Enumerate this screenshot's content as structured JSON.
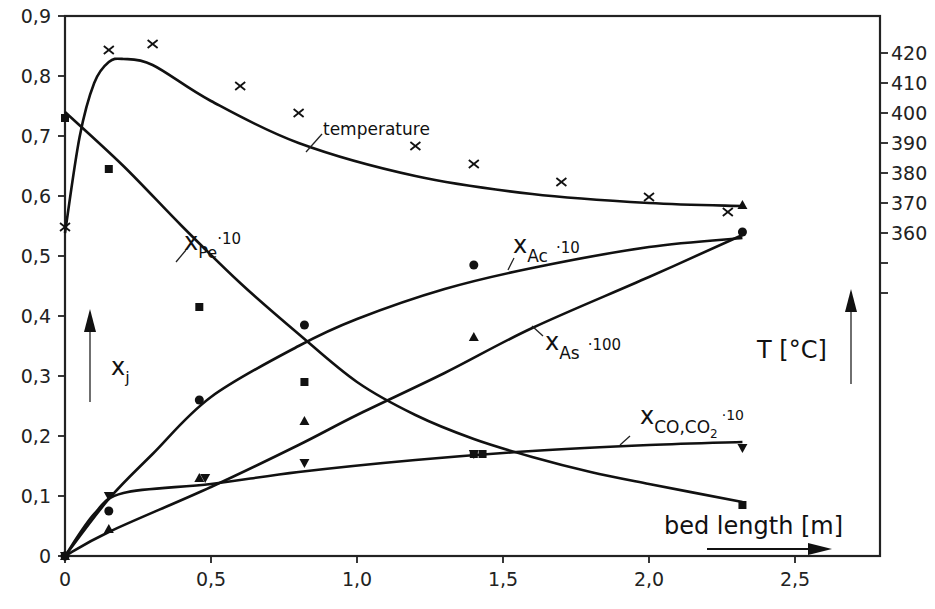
{
  "chart_data": {
    "type": "line",
    "title": "",
    "xlabel": "bed length [m]",
    "ylabel": "x_j",
    "ylabel_right": "T [°C]",
    "xlim": [
      0,
      2.8
    ],
    "ylim": [
      0,
      0.9
    ],
    "ylim_right_ticks": [
      360,
      420
    ],
    "x_ticks": [
      "0",
      "0,5",
      "1,0",
      "1,5",
      "2,0",
      "2,5"
    ],
    "y_ticks": [
      "0",
      "0,1",
      "0,2",
      "0,3",
      "0,4",
      "0,5",
      "0,6",
      "0,7",
      "0,8",
      "0,9"
    ],
    "y_right_ticks": [
      "360",
      "370",
      "380",
      "390",
      "400",
      "410",
      "420"
    ],
    "grid": false,
    "legend": "inline annotations",
    "series": [
      {
        "name": "temperature",
        "axis": "right",
        "marker": "x",
        "points_x": [
          0.0,
          0.15,
          0.3,
          0.6,
          0.8,
          1.2,
          1.4,
          1.7,
          2.0,
          2.27
        ],
        "points_y": [
          362,
          421,
          423,
          409,
          400,
          389,
          383,
          377,
          372,
          367
        ],
        "curve_x": [
          0.0,
          0.05,
          0.1,
          0.15,
          0.2,
          0.3,
          0.5,
          0.8,
          1.2,
          1.6,
          2.0,
          2.32
        ],
        "curve_y": [
          360,
          392,
          410,
          417,
          418,
          416,
          404,
          390,
          379,
          373,
          370,
          369
        ]
      },
      {
        "name": "x_Pe · 10",
        "axis": "left",
        "marker": "square",
        "points_x": [
          0.0,
          0.15,
          0.46,
          0.82,
          1.4,
          1.43,
          2.32
        ],
        "points_y": [
          0.73,
          0.645,
          0.415,
          0.29,
          0.17,
          0.17,
          0.085
        ],
        "curve_x": [
          0.0,
          0.2,
          0.4,
          0.6,
          0.8,
          1.0,
          1.2,
          1.4,
          1.6,
          1.8,
          2.0,
          2.32
        ],
        "curve_y": [
          0.74,
          0.65,
          0.55,
          0.455,
          0.37,
          0.29,
          0.235,
          0.195,
          0.165,
          0.14,
          0.12,
          0.09
        ]
      },
      {
        "name": "x_Ac · 10",
        "axis": "left",
        "marker": "circle",
        "points_x": [
          0.0,
          0.15,
          0.46,
          0.82,
          1.4,
          2.32
        ],
        "points_y": [
          0.0,
          0.075,
          0.26,
          0.385,
          0.485,
          0.54
        ],
        "curve_x": [
          0.0,
          0.15,
          0.3,
          0.5,
          0.8,
          1.0,
          1.3,
          1.6,
          2.0,
          2.32
        ],
        "curve_y": [
          0.0,
          0.095,
          0.17,
          0.265,
          0.35,
          0.395,
          0.445,
          0.48,
          0.515,
          0.53
        ]
      },
      {
        "name": "x_As · 100",
        "axis": "left",
        "marker": "triangle-up",
        "points_x": [
          0.0,
          0.15,
          0.46,
          0.82,
          1.4,
          2.32
        ],
        "points_y": [
          0.0,
          0.045,
          0.13,
          0.225,
          0.365,
          0.585
        ],
        "curve_x": [
          0.0,
          0.15,
          0.5,
          0.8,
          1.0,
          1.3,
          1.6,
          2.0,
          2.32
        ],
        "curve_y": [
          0.0,
          0.04,
          0.115,
          0.185,
          0.235,
          0.305,
          0.38,
          0.465,
          0.535
        ]
      },
      {
        "name": "x_CO,CO2 · 10",
        "axis": "left",
        "marker": "triangle-down",
        "points_x": [
          0.0,
          0.15,
          0.48,
          0.82,
          1.4,
          2.32
        ],
        "points_y": [
          0.0,
          0.1,
          0.13,
          0.155,
          0.17,
          0.18
        ],
        "curve_x": [
          0.0,
          0.1,
          0.2,
          0.5,
          0.8,
          1.2,
          1.6,
          2.0,
          2.32
        ],
        "curve_y": [
          0.0,
          0.07,
          0.105,
          0.12,
          0.14,
          0.16,
          0.175,
          0.185,
          0.19
        ]
      }
    ],
    "annotations": [
      "temperature",
      "x_Pe ·10",
      "x_Ac ·10",
      "x_As ·100",
      "x_CO,CO2 ·10",
      "x_j",
      "T [°C]",
      "bed length [m]"
    ]
  },
  "labels": {
    "temperature": "temperature",
    "pe_main": "x",
    "pe_sub": "Pe",
    "pe_factor": "·10",
    "ac_main": "x",
    "ac_sub": "Ac",
    "ac_factor": "·10",
    "as_main": "x",
    "as_sub": "As",
    "as_factor": "·100",
    "co_main": "x",
    "co_sub": "CO,CO",
    "co_sub2": "2",
    "co_factor": "·10",
    "xj_main": "x",
    "xj_sub": "j",
    "t_axis": "T [°C]",
    "bed_length": "bed length [m]"
  }
}
